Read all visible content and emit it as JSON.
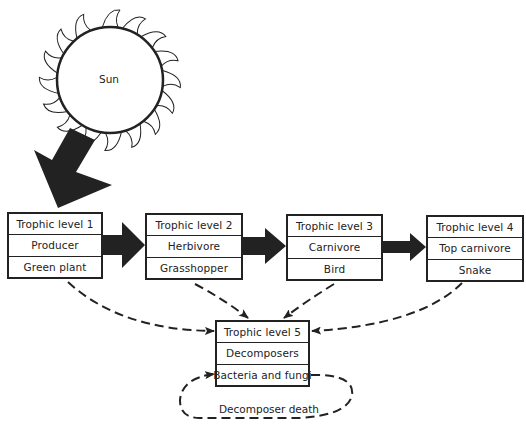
{
  "sun": {
    "label": "Sun"
  },
  "trophic_levels": [
    {
      "level": "Trophic level 1",
      "role": "Producer",
      "organism": "Green plant"
    },
    {
      "level": "Trophic level 2",
      "role": "Herbivore",
      "organism": "Grasshopper"
    },
    {
      "level": "Trophic level 3",
      "role": "Carnivore",
      "organism": "Bird"
    },
    {
      "level": "Trophic level 4",
      "role": "Top carnivore",
      "organism": "Snake"
    },
    {
      "level": "Trophic level 5",
      "role": "Decomposers",
      "organism": "Bacteria and fungi"
    }
  ],
  "loop_label": "Decomposer death",
  "colors": {
    "ink": "#222222",
    "background": "#ffffff"
  }
}
